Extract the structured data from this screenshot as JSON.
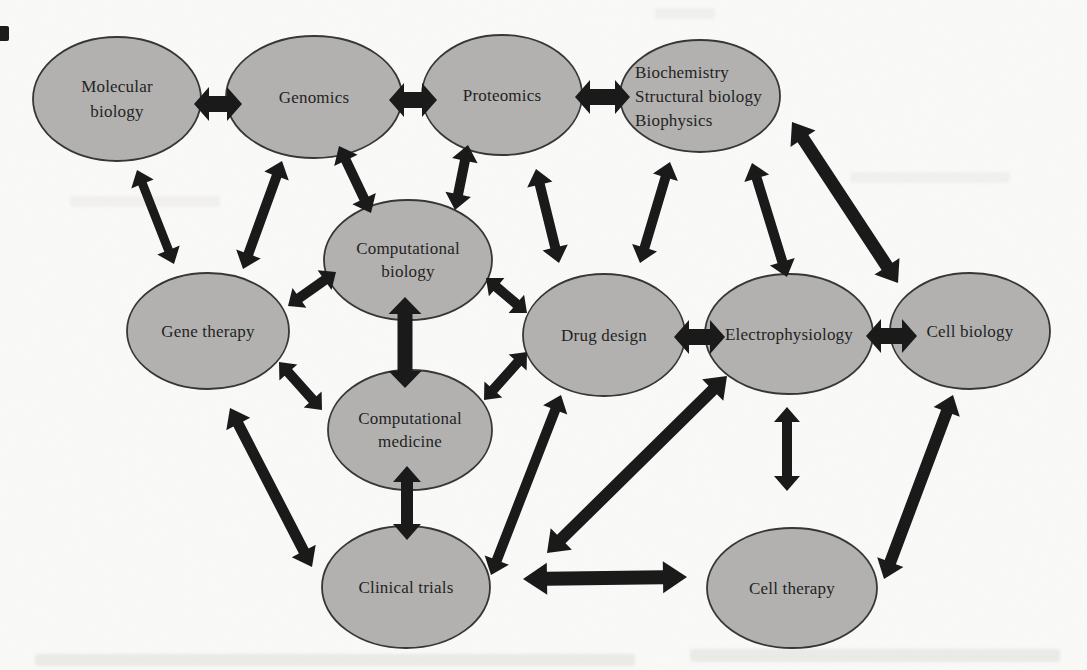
{
  "page": {
    "background": "#fbfbf9"
  },
  "diagram": {
    "type": "network",
    "canvas": {
      "width": 1087,
      "height": 670
    },
    "style": {
      "node_fill": "#b3b2b0",
      "node_stroke": "#343434",
      "node_stroke_width": 1.8,
      "arrow_fill": "#171717",
      "label_color": "#1d1d1d",
      "font_size": 17,
      "default_line_height": 25
    },
    "nodes": [
      {
        "id": "molecular-biology",
        "label": [
          "Molecular",
          "biology"
        ],
        "x": 117,
        "y": 99,
        "rx": 84,
        "ry": 62
      },
      {
        "id": "genomics",
        "label": [
          "Genomics"
        ],
        "x": 314,
        "y": 97,
        "rx": 88,
        "ry": 61
      },
      {
        "id": "proteomics",
        "label": [
          "Proteomics"
        ],
        "x": 502,
        "y": 95,
        "rx": 80,
        "ry": 60
      },
      {
        "id": "biochemistry",
        "label": [
          "Biochemistry",
          "Structural biology",
          "Biophysics"
        ],
        "x": 700,
        "y": 96,
        "rx": 80,
        "ry": 56,
        "align": "left",
        "label_x": 635,
        "line_height": 24
      },
      {
        "id": "gene-therapy",
        "label": [
          "Gene therapy"
        ],
        "x": 208,
        "y": 331,
        "rx": 81,
        "ry": 58
      },
      {
        "id": "computational-biology",
        "label": [
          "Computational",
          "biology"
        ],
        "x": 408,
        "y": 260,
        "rx": 84,
        "ry": 60,
        "line_height": 23
      },
      {
        "id": "drug-design",
        "label": [
          "Drug design"
        ],
        "x": 604,
        "y": 335,
        "rx": 81,
        "ry": 61
      },
      {
        "id": "electrophysiology",
        "label": [
          "Electrophysiology"
        ],
        "x": 789,
        "y": 334,
        "rx": 84,
        "ry": 60
      },
      {
        "id": "cell-biology",
        "label": [
          "Cell biology"
        ],
        "x": 970,
        "y": 331,
        "rx": 80,
        "ry": 58
      },
      {
        "id": "computational-medicine",
        "label": [
          "Computational",
          "medicine"
        ],
        "x": 410,
        "y": 430,
        "rx": 82,
        "ry": 60,
        "line_height": 23
      },
      {
        "id": "clinical-trials",
        "label": [
          "Clinical trials"
        ],
        "x": 406,
        "y": 587,
        "rx": 84,
        "ry": 61
      },
      {
        "id": "cell-therapy",
        "label": [
          "Cell therapy"
        ],
        "x": 792,
        "y": 588,
        "rx": 85,
        "ry": 60
      }
    ],
    "edges": [
      {
        "from": "molecular-biology",
        "to": "genomics",
        "x1": 194,
        "y1": 104,
        "x2": 242,
        "y2": 104,
        "stem": 16,
        "head_w": 34,
        "head_len": 15
      },
      {
        "from": "genomics",
        "to": "proteomics",
        "x1": 389,
        "y1": 100,
        "x2": 437,
        "y2": 100,
        "stem": 16,
        "head_w": 34,
        "head_len": 15
      },
      {
        "from": "proteomics",
        "to": "biochemistry",
        "x1": 575,
        "y1": 97,
        "x2": 630,
        "y2": 97,
        "stem": 16,
        "head_w": 34,
        "head_len": 15
      },
      {
        "from": "molecular-biology",
        "to": "gene-therapy",
        "x1": 137,
        "y1": 170,
        "x2": 174,
        "y2": 264,
        "stem": 9,
        "head_w": 24,
        "head_len": 15
      },
      {
        "from": "genomics",
        "to": "gene-therapy",
        "x1": 282,
        "y1": 161,
        "x2": 243,
        "y2": 269,
        "stem": 10,
        "head_w": 26,
        "head_len": 16
      },
      {
        "from": "genomics",
        "to": "computational-biology",
        "x1": 339,
        "y1": 146,
        "x2": 371,
        "y2": 213,
        "stem": 10,
        "head_w": 26,
        "head_len": 16
      },
      {
        "from": "proteomics",
        "to": "computational-biology",
        "x1": 468,
        "y1": 145,
        "x2": 455,
        "y2": 210,
        "stem": 10,
        "head_w": 26,
        "head_len": 16
      },
      {
        "from": "proteomics",
        "to": "drug-design",
        "x1": 536,
        "y1": 169,
        "x2": 559,
        "y2": 263,
        "stem": 10,
        "head_w": 26,
        "head_len": 16
      },
      {
        "from": "biochemistry",
        "to": "drug-design",
        "x1": 670,
        "y1": 162,
        "x2": 640,
        "y2": 263,
        "stem": 10,
        "head_w": 26,
        "head_len": 16
      },
      {
        "from": "biochemistry",
        "to": "electrophysiology",
        "x1": 752,
        "y1": 163,
        "x2": 787,
        "y2": 277,
        "stem": 10,
        "head_w": 26,
        "head_len": 16
      },
      {
        "from": "biochemistry",
        "to": "cell-biology",
        "x1": 792,
        "y1": 122,
        "x2": 898,
        "y2": 283,
        "stem": 13,
        "head_w": 30,
        "head_len": 20
      },
      {
        "from": "gene-therapy",
        "to": "computational-biology",
        "x1": 288,
        "y1": 306,
        "x2": 336,
        "y2": 272,
        "stem": 10,
        "head_w": 24,
        "head_len": 14
      },
      {
        "from": "computational-biology",
        "to": "drug-design",
        "x1": 486,
        "y1": 278,
        "x2": 527,
        "y2": 313,
        "stem": 10,
        "head_w": 24,
        "head_len": 14
      },
      {
        "from": "computational-biology",
        "to": "computational-medicine",
        "x1": 405,
        "y1": 297,
        "x2": 405,
        "y2": 388,
        "stem": 15,
        "head_w": 33,
        "head_len": 17
      },
      {
        "from": "gene-therapy",
        "to": "computational-medicine",
        "x1": 279,
        "y1": 362,
        "x2": 322,
        "y2": 410,
        "stem": 10,
        "head_w": 24,
        "head_len": 14
      },
      {
        "from": "gene-therapy",
        "to": "clinical-trials",
        "x1": 230,
        "y1": 408,
        "x2": 312,
        "y2": 567,
        "stem": 11,
        "head_w": 27,
        "head_len": 18
      },
      {
        "from": "computational-medicine",
        "to": "clinical-trials",
        "x1": 407,
        "y1": 466,
        "x2": 407,
        "y2": 540,
        "stem": 12,
        "head_w": 28,
        "head_len": 16
      },
      {
        "from": "computational-medicine",
        "to": "drug-design",
        "x1": 484,
        "y1": 400,
        "x2": 527,
        "y2": 352,
        "stem": 10,
        "head_w": 24,
        "head_len": 14
      },
      {
        "from": "drug-design",
        "to": "electrophysiology",
        "x1": 674,
        "y1": 337,
        "x2": 725,
        "y2": 337,
        "stem": 16,
        "head_w": 34,
        "head_len": 15
      },
      {
        "from": "electrophysiology",
        "to": "cell-biology",
        "x1": 866,
        "y1": 336,
        "x2": 917,
        "y2": 336,
        "stem": 16,
        "head_w": 34,
        "head_len": 15
      },
      {
        "from": "drug-design",
        "to": "clinical-trials",
        "x1": 561,
        "y1": 395,
        "x2": 491,
        "y2": 575,
        "stem": 10,
        "head_w": 26,
        "head_len": 16
      },
      {
        "from": "electrophysiology",
        "to": "clinical-trials",
        "x1": 727,
        "y1": 376,
        "x2": 547,
        "y2": 553,
        "stem": 12,
        "head_w": 30,
        "head_len": 20
      },
      {
        "from": "electrophysiology",
        "to": "cell-therapy",
        "x1": 787,
        "y1": 407,
        "x2": 787,
        "y2": 491,
        "stem": 10,
        "head_w": 26,
        "head_len": 15
      },
      {
        "from": "cell-biology",
        "to": "cell-therapy",
        "x1": 953,
        "y1": 395,
        "x2": 884,
        "y2": 579,
        "stem": 12,
        "head_w": 28,
        "head_len": 18
      },
      {
        "from": "clinical-trials",
        "to": "cell-therapy",
        "x1": 523,
        "y1": 579,
        "x2": 687,
        "y2": 577,
        "stem": 14,
        "head_w": 32,
        "head_len": 24
      }
    ]
  }
}
